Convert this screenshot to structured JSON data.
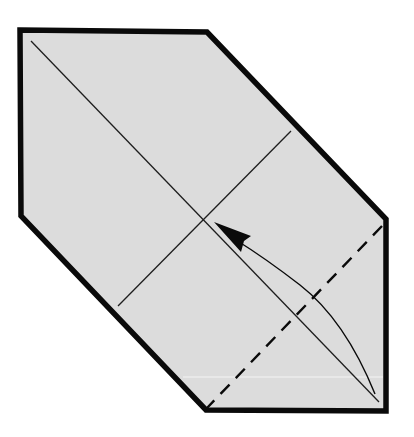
{
  "diagram": {
    "title": "Origami folding step: fold corner up to center",
    "description": "Folded paper hexagon with diagonal and cross creases; valley fold (dashed) at bottom-right corner; curved arrow shows folding the bottom-right corner to the center point.",
    "colors": {
      "background": "#ffffff",
      "paper_fill": "#dcdcdc",
      "outline": "#0a0a0a",
      "crease": "#1e1e1e",
      "arrow": "#0a0a0a",
      "highlight": "#f4f4f4"
    },
    "paper_outline": [
      [
        20,
        30
      ],
      [
        207,
        32
      ],
      [
        386,
        219
      ],
      [
        386,
        411
      ],
      [
        206,
        410
      ],
      [
        21,
        216
      ]
    ],
    "creases": [
      {
        "name": "main-diagonal",
        "from": [
          31,
          41
        ],
        "to": [
          379,
          402
        ]
      },
      {
        "name": "cross-line",
        "from": [
          291,
          131
        ],
        "to": [
          118,
          306
        ]
      }
    ],
    "valley_fold": {
      "from": [
        382,
        226
      ],
      "to": [
        207,
        408
      ],
      "style": "dashed"
    },
    "center_point": [
      204,
      220
    ],
    "arrow": {
      "start": [
        375,
        394
      ],
      "control": [
        330,
        300
      ],
      "end": [
        232,
        241
      ],
      "head_tip": [
        214,
        222
      ],
      "meaning": "fold corner to center"
    },
    "paper_edge_highlight": {
      "from": [
        183,
        377
      ],
      "to": [
        383,
        377
      ]
    }
  }
}
